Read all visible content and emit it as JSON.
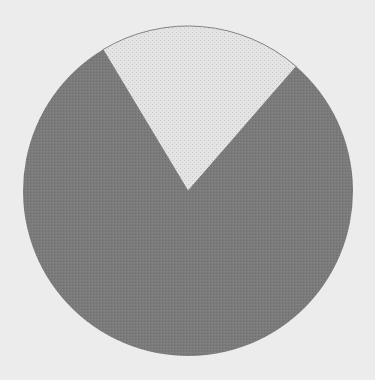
{
  "chart_data": {
    "type": "pie",
    "title": "",
    "start_angle_deg": -31,
    "direction": "clockwise",
    "slices": [
      {
        "label": "",
        "value": 20,
        "color": "#e2e2e2",
        "pattern": "dotted-light"
      },
      {
        "label": "",
        "value": 80,
        "color": "#7c7c7c",
        "pattern": "solid-dark"
      }
    ],
    "legend": [],
    "center": [
      188,
      191
    ],
    "radius": 165,
    "background": "#ececec"
  }
}
